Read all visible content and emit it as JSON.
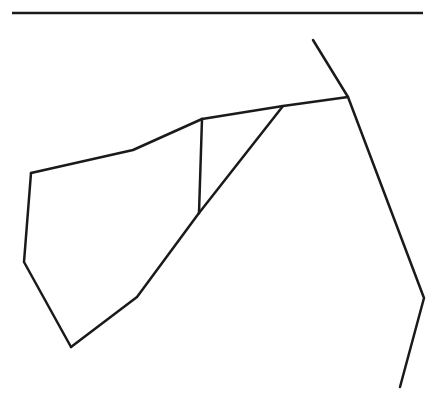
{
  "diagram": {
    "width": 444,
    "height": 406,
    "stroke": "#1a1a1a",
    "background": "#ffffff",
    "header_rule": {
      "x1": 12,
      "y1": 13,
      "x2": 423,
      "y2": 13,
      "width": 2.5
    },
    "segments": [
      {
        "name": "polygon-edge-top-left",
        "points": [
          [
            31,
            173
          ],
          [
            133,
            150
          ],
          [
            202,
            119
          ]
        ]
      },
      {
        "name": "polygon-edge-top",
        "points": [
          [
            202,
            119
          ],
          [
            283,
            106
          ],
          [
            348,
            97
          ]
        ]
      },
      {
        "name": "polygon-edge-left",
        "points": [
          [
            31,
            173
          ],
          [
            24,
            262
          ],
          [
            71,
            347
          ]
        ]
      },
      {
        "name": "polygon-edge-bottom",
        "points": [
          [
            71,
            347
          ],
          [
            137,
            297
          ],
          [
            199,
            213
          ]
        ]
      },
      {
        "name": "diagonal-edge",
        "points": [
          [
            199,
            213
          ],
          [
            283,
            106
          ]
        ]
      },
      {
        "name": "vertical-edge",
        "points": [
          [
            202,
            119
          ],
          [
            199,
            213
          ]
        ]
      },
      {
        "name": "right-boundary-line",
        "points": [
          [
            313,
            40
          ],
          [
            348,
            97
          ],
          [
            424,
            298
          ],
          [
            400,
            387
          ]
        ]
      }
    ],
    "stroke_width": 2.5
  }
}
